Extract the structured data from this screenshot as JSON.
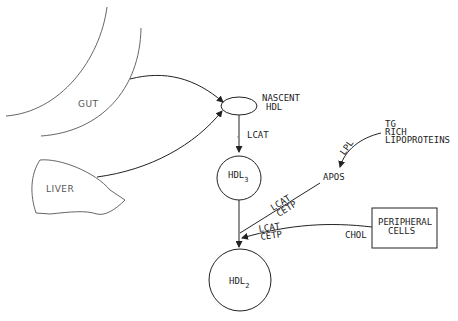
{
  "diagram": {
    "type": "metabolic-pathway",
    "nodes": {
      "gut": {
        "label": "GUT"
      },
      "liver": {
        "label": "LIVER"
      },
      "nascent_hdl": {
        "label_line1": "NASCENT",
        "label_line2": "HDL"
      },
      "hdl3": {
        "label": "HDL",
        "subscript": "3"
      },
      "hdl2": {
        "label": "HDL",
        "subscript": "2"
      },
      "tg_rich": {
        "label_line1": "TG",
        "label_line2": "RICH",
        "label_line3": "LIPOPROTEINS"
      },
      "apos": {
        "label": "APOS"
      },
      "peripheral_cells": {
        "label_line1": "PERIPHERAL",
        "label_line2": "CELLS"
      }
    },
    "edges": {
      "gut_to_nascent": {
        "from": "GUT",
        "to": "NASCENT HDL"
      },
      "liver_to_nascent": {
        "from": "LIVER",
        "to": "NASCENT HDL"
      },
      "nascent_to_hdl3": {
        "from": "NASCENT HDL",
        "to": "HDL3",
        "label": "LCAT"
      },
      "tg_to_apos": {
        "from": "TG RICH LIPOPROTEINS",
        "to": "APOS",
        "label": "LPL"
      },
      "apos_to_hdl2": {
        "from": "APOS",
        "to": "HDL2",
        "label_line1": "LCAT",
        "label_line2": "CETP"
      },
      "peripheral_to_hdl2": {
        "from": "PERIPHERAL CELLS",
        "to": "HDL2",
        "label_line1": "LCAT",
        "label_line2": "CETP",
        "source_label": "CHOL"
      },
      "hdl3_to_hdl2": {
        "from": "HDL3",
        "to": "HDL2"
      }
    }
  }
}
